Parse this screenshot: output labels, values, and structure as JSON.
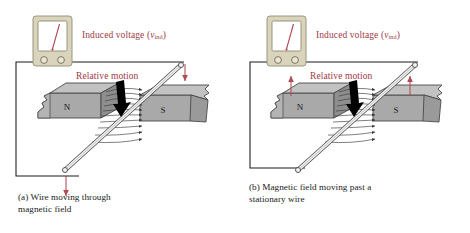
{
  "figure": {
    "background_color": "#ffffff",
    "label_color": "#9e3a44",
    "caption_color": "#1a1a1a",
    "magnet_fill": "#a9a9a9",
    "magnet_top_fill": "#c2c2c2",
    "magnet_side_fill": "#8e8e8e",
    "meter_body_color": "#d9d4bb",
    "meter_screen_color": "#ffffff",
    "needle_color": "#b04a55",
    "wire_color": "#1a1a1a",
    "field_line_color": "#3a3a3a",
    "motion_arrow_color": "#000000",
    "red_arrow_color": "#b04a55"
  },
  "panels": [
    {
      "id": "a",
      "meter": {
        "name": "voltmeter",
        "needle_angle_deg": -18,
        "terminals": 2
      },
      "labels": {
        "induced_voltage": {
          "text_prefix": "Induced voltage (",
          "symbol": "v",
          "subscript": "ind",
          "text_suffix": ")",
          "full_text": "Induced voltage (vind)"
        },
        "relative_motion": "Relative motion",
        "north_pole": "N",
        "south_pole": "S"
      },
      "motion": {
        "direction": "down",
        "arrow_color": "#000000",
        "red_arrows": [
          "wire-top-down",
          "wire-bottom-down"
        ]
      },
      "field_lines": {
        "count": 9,
        "direction": "left-to-right",
        "from": "N",
        "to": "S"
      },
      "caption": "(a) Wire moving through\n      magnetic field"
    },
    {
      "id": "b",
      "meter": {
        "name": "voltmeter",
        "needle_angle_deg": -18,
        "terminals": 2
      },
      "labels": {
        "induced_voltage": {
          "text_prefix": "Induced voltage (",
          "symbol": "v",
          "subscript": "ind",
          "text_suffix": ")",
          "full_text": "Induced voltage (vind)"
        },
        "relative_motion": "Relative motion",
        "north_pole": "N",
        "south_pole": "S"
      },
      "motion": {
        "direction": "down",
        "arrow_color": "#000000",
        "red_arrows": [
          "magnet-n-up",
          "magnet-s-up"
        ]
      },
      "field_lines": {
        "count": 9,
        "direction": "left-to-right",
        "from": "N",
        "to": "S"
      },
      "caption": "(b) Magnetic field moving past a\n       stationary wire"
    }
  ]
}
